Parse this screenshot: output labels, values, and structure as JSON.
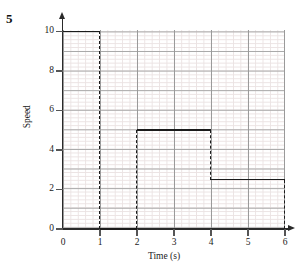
{
  "question_number": "5",
  "chart_data": {
    "type": "line",
    "title": "",
    "xlabel": "Time (s)",
    "ylabel": "Speed",
    "xlim": [
      0,
      6
    ],
    "ylim": [
      0,
      10
    ],
    "xticks": [
      0,
      1,
      2,
      3,
      4,
      5,
      6
    ],
    "xtick_labels": [
      "0",
      "1",
      "2",
      "3",
      "4",
      "5",
      "6"
    ],
    "yticks": [
      0,
      2,
      4,
      6,
      8,
      10
    ],
    "ytick_labels": [
      "0",
      "2",
      "4",
      "6",
      "8",
      "10"
    ],
    "grid": true,
    "grid_major_step_x": 1,
    "grid_major_step_y": 1,
    "grid_minor_step_x": 0.2,
    "grid_minor_step_y": 0.2,
    "legend": "none",
    "line_color": "#1b1b1b",
    "grid_major_color": "#9a9a9a",
    "grid_minor_color": "#ebe3e3",
    "axis_color": "#2a2a2a",
    "series": [
      {
        "name": "Speed",
        "style": "step",
        "points": [
          {
            "x": 0,
            "y": 10
          },
          {
            "x": 1,
            "y": 10
          },
          {
            "x": 1,
            "y": 0
          },
          {
            "x": 2,
            "y": 0
          },
          {
            "x": 2,
            "y": 5
          },
          {
            "x": 4,
            "y": 5
          },
          {
            "x": 4,
            "y": 2.5
          },
          {
            "x": 6,
            "y": 2.5
          },
          {
            "x": 6,
            "y": 0
          }
        ],
        "segments_horizontal": [
          {
            "y": 10,
            "x_start": 0,
            "x_end": 1,
            "dash": false
          },
          {
            "y": 0,
            "x_start": 1,
            "x_end": 2,
            "dash": false
          },
          {
            "y": 5,
            "x_start": 2,
            "x_end": 4,
            "dash": false
          },
          {
            "y": 2.5,
            "x_start": 4,
            "x_end": 6,
            "dash": false
          }
        ],
        "segments_vertical": [
          {
            "x": 1,
            "y_start": 10,
            "y_end": 0,
            "dash": true
          },
          {
            "x": 2,
            "y_start": 0,
            "y_end": 5,
            "dash": true
          },
          {
            "x": 4,
            "y_start": 5,
            "y_end": 2.5,
            "dash": true
          },
          {
            "x": 6,
            "y_start": 2.5,
            "y_end": 0,
            "dash": true
          }
        ]
      }
    ]
  }
}
